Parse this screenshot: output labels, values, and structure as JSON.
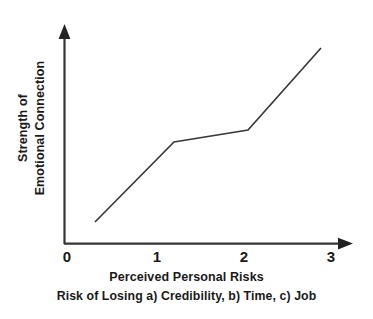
{
  "figure": {
    "background_color": "#ffffff",
    "line_color": "#3a3a3a",
    "axis_color": "#333333",
    "text_color": "#1a1a1a"
  },
  "axes": {
    "y_label_line1": "Strength of",
    "y_label_line2": "Emotional Connection",
    "x_caption_line1": "Perceived Personal Risks",
    "x_caption_line2": "Risk of Losing a) Credibility, b) Time, c) Job",
    "x_ticks": [
      "0",
      "1",
      "2",
      "3"
    ]
  },
  "chart_data": {
    "type": "line",
    "title": "",
    "subtitle": "",
    "xlabel": "Perceived Personal Risks",
    "xlabel_secondary": "Risk of Losing a) Credibility, b) Time, c) Job",
    "ylabel": "Strength of Emotional Connection",
    "xlim": [
      0,
      3
    ],
    "ylim": [
      0,
      1
    ],
    "xticks": [
      0,
      1,
      2,
      3
    ],
    "xticklabels": [
      "0",
      "1",
      "2",
      "3"
    ],
    "yticks": [],
    "yticklabels": [],
    "grid": false,
    "legend": false,
    "legend_position": "none",
    "series": [
      {
        "name": "Emotional connection vs perceived risk",
        "x": [
          0.35,
          1.22,
          2.05,
          2.86
        ],
        "y": [
          0.1,
          0.47,
          0.52,
          0.9
        ],
        "points_pixel": [
          {
            "x": 95,
            "y": 222
          },
          {
            "x": 174,
            "y": 142
          },
          {
            "x": 248,
            "y": 130
          },
          {
            "x": 321,
            "y": 48
          }
        ],
        "segments": [
          {
            "from_x": 0.35,
            "to_x": 1.22,
            "slope": "steep rise"
          },
          {
            "from_x": 1.22,
            "to_x": 2.05,
            "slope": "shallow plateau"
          },
          {
            "from_x": 2.05,
            "to_x": 2.86,
            "slope": "steep rise"
          }
        ]
      }
    ]
  }
}
